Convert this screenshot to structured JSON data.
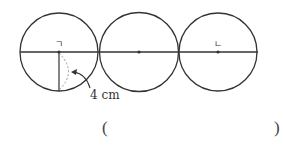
{
  "diagram": {
    "type": "three tangent circles on a line",
    "circles": [
      {
        "center_label": "ㄱ",
        "cx": 59,
        "cy": 52,
        "r": 39
      },
      {
        "center_label": "",
        "cx": 139,
        "cy": 52,
        "r": 39
      },
      {
        "center_label": "ㄴ",
        "cx": 218,
        "cy": 52,
        "r": 39
      }
    ],
    "line": {
      "x1": 20,
      "x2": 258,
      "y": 52
    },
    "radius_label": "4 cm",
    "colors": {
      "stroke": "#333333",
      "dashed": "#999999",
      "background": "#ffffff"
    }
  },
  "answer": {
    "open_paren": "(",
    "close_paren": ")",
    "value": ""
  }
}
